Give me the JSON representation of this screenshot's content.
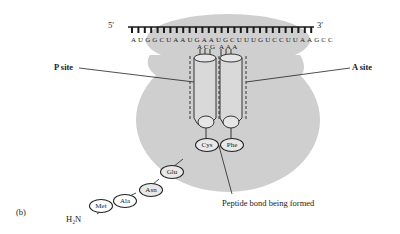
{
  "figure": {
    "panel_label": "(b)",
    "mrna": {
      "five_prime": "5′",
      "three_prime": "3′",
      "sequence": "AUGGCUAAUGAAUGCUUUGUCCUUAAGCC"
    },
    "trna_p": {
      "anticodon": "ACG",
      "amino_acid": "Cys"
    },
    "trna_a": {
      "anticodon": "AAA",
      "amino_acid": "Phe"
    },
    "labels": {
      "p_site": "P site",
      "a_site": "A site",
      "peptide_bond": "Peptide bond being formed",
      "amino_terminus": "H₂N"
    },
    "peptide_chain": [
      "Met",
      "Ala",
      "Asn",
      "Glu",
      "Cys"
    ],
    "colors": {
      "ribosome": "#cfcfcf",
      "line": "#222222",
      "background": "#ffffff"
    }
  }
}
